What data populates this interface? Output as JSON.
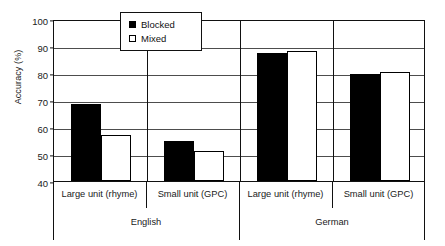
{
  "chart_data": {
    "type": "bar",
    "title": "",
    "xlabel": "",
    "ylabel": "Accuracy (%)",
    "ylim": [
      40,
      100
    ],
    "yticks": [
      40,
      50,
      60,
      70,
      80,
      90,
      100
    ],
    "grid": true,
    "legend_position": "top-center",
    "categories": [
      "English / Large unit (rhyme)",
      "English / Small unit (GPC)",
      "German / Large unit (rhyme)",
      "German / Small unit (GPC)"
    ],
    "series": [
      {
        "name": "Blocked",
        "color": "#000000",
        "values": [
          68.5,
          55.0,
          87.5,
          79.5
        ]
      },
      {
        "name": "Mixed",
        "color": "#ffffff",
        "values": [
          57.0,
          51.0,
          88.0,
          80.5
        ]
      }
    ],
    "groups": [
      {
        "label": "English",
        "units": [
          {
            "label": "Large unit (rhyme)",
            "blocked": 68.5,
            "mixed": 57.0
          },
          {
            "label": "Small unit (GPC)",
            "blocked": 55.0,
            "mixed": 51.0
          }
        ]
      },
      {
        "label": "German",
        "units": [
          {
            "label": "Large unit (rhyme)",
            "blocked": 87.5,
            "mixed": 88.0
          },
          {
            "label": "Small unit (GPC)",
            "blocked": 79.5,
            "mixed": 80.5
          }
        ]
      }
    ]
  },
  "axis": {
    "y_title": "Accuracy (%)",
    "y_tick_labels": [
      "100",
      "90",
      "80",
      "70",
      "60",
      "50",
      "40"
    ]
  },
  "legend": {
    "items": [
      {
        "label": "Blocked",
        "swatch": "filled-square"
      },
      {
        "label": "Mixed",
        "swatch": "open-square"
      }
    ]
  },
  "x_axis": {
    "unit_labels": [
      "Large unit (rhyme)",
      "Small unit (GPC)",
      "Large unit (rhyme)",
      "Small unit (GPC)"
    ],
    "group_labels": [
      "English",
      "German"
    ]
  }
}
